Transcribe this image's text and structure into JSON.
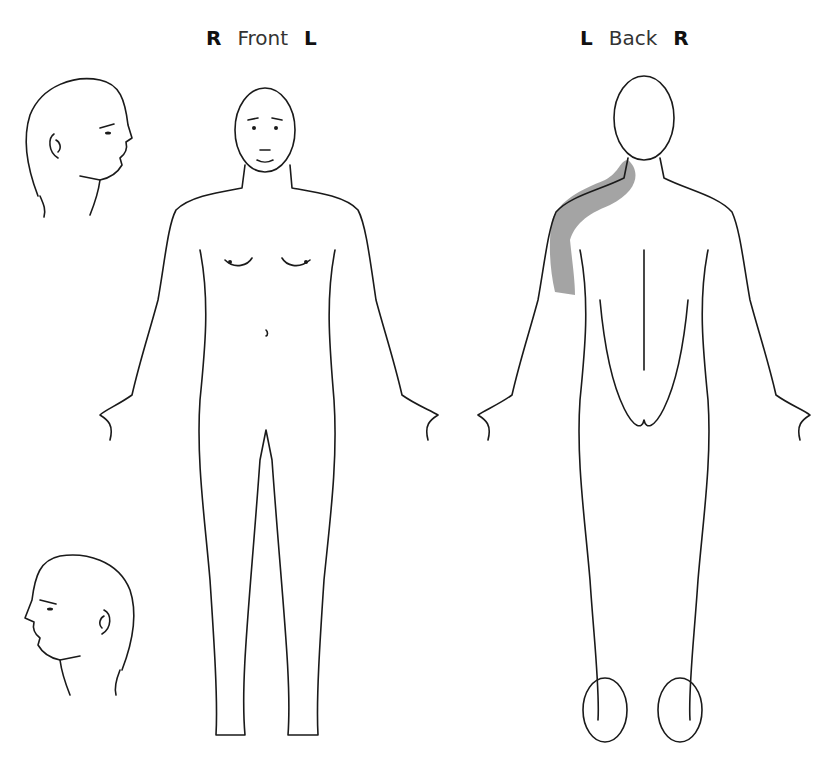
{
  "views": {
    "front": {
      "left_marker": "R",
      "title": "Front",
      "right_marker": "L"
    },
    "back": {
      "left_marker": "L",
      "title": "Back",
      "right_marker": "R"
    }
  },
  "highlight": {
    "region": "left shoulder to upper arm (back view)",
    "color": "#9a9a9a"
  },
  "line_color": "#1a1a1a"
}
